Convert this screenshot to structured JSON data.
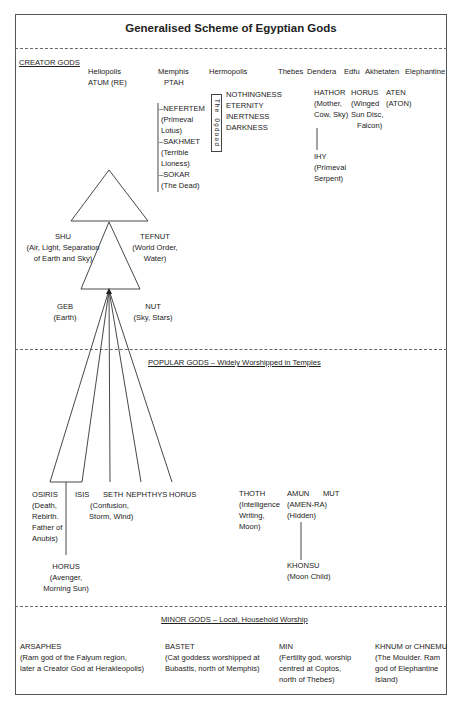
{
  "title": "Generalised Scheme of Egyptian Gods",
  "sections": {
    "creator": {
      "label": "CREATOR GODS",
      "places": [
        "Heliopolis",
        "Memphis",
        "Hermopolis",
        "Thebes",
        "Dendera",
        "Edfu",
        "Akhetaten",
        "Elephantine"
      ],
      "heliopolis_god": "ATUM (RE)",
      "memphis": {
        "god": "PTAH",
        "children": [
          "–NEFERTEM",
          "(Primeval",
          "Lotus)",
          "–SAKHMET",
          "(Terrible",
          "Lioness)",
          "–SOKAR",
          "(The Dead)"
        ]
      },
      "hermopolis": {
        "group_label": "The Ogdoad",
        "gods": [
          "NOTHINGNESS",
          "ETERNITY",
          "INERTNESS",
          "DARKNESS"
        ]
      },
      "dendera": {
        "name": "HATHOR",
        "desc1": "(Mother,",
        "desc2": "Cow, Sky)",
        "child": "IHY",
        "child_desc1": "(Primeval",
        "child_desc2": "Serpent)"
      },
      "edfu": {
        "name": "HORUS",
        "desc1": "(Winged",
        "desc2": "Sun Disc,",
        "desc3": "Falcon)"
      },
      "akhetaten": {
        "name": "ATEN",
        "desc1": "(ATON)"
      },
      "shu": {
        "name": "SHU",
        "desc1": "(Air, Light, Separation",
        "desc2": "of Earth and Sky)"
      },
      "tefnut": {
        "name": "TEFNUT",
        "desc1": "(World Order,",
        "desc2": "Water)"
      },
      "geb": {
        "name": "GEB",
        "desc1": "(Earth)"
      },
      "nut": {
        "name": "NUT",
        "desc1": "(Sky, Stars)"
      }
    },
    "popular": {
      "label": "POPULAR GODS – Widely Worshipped in Temples",
      "osiris": {
        "name": "OSIRIS",
        "lines": [
          "(Death,",
          "Rebirth.",
          "Father of",
          "Anubis)"
        ]
      },
      "isis": {
        "name": "ISIS"
      },
      "seth": {
        "name": "SETH",
        "desc1": "(Confusion,",
        "desc2": "Storm, Wind)"
      },
      "nephthys": {
        "name": "NEPHTHYS"
      },
      "horus": {
        "name": "HORUS"
      },
      "horus_child": {
        "name": "HORUS",
        "desc1": "(Avenger,",
        "desc2": "Morning Sun)"
      },
      "thoth": {
        "name": "THOTH",
        "lines": [
          "(Intelligence",
          "Writing,",
          "Moon)"
        ]
      },
      "amun": {
        "name": "AMUN",
        "desc1": "(AMEN-RA)",
        "desc2": "(Hidden)"
      },
      "mut": {
        "name": "MUT"
      },
      "khonsu": {
        "name": "KHONSU",
        "desc1": "(Moon Child)"
      }
    },
    "minor": {
      "label": "MINOR GODS – Local, Household Worship",
      "gods": [
        {
          "name": "ARSAPHES",
          "lines": [
            "(Ram god of the Faiyum region,",
            "later a Creator God at Herakleopolis)"
          ]
        },
        {
          "name": "BASTET",
          "lines": [
            "(Cat goddess worshipped at",
            "Bubastis, north of Memphis)"
          ]
        },
        {
          "name": "MIN",
          "lines": [
            "(Fertility god, worship",
            "centred at Coptos,",
            "north of Thebes)"
          ]
        },
        {
          "name": "KHNUM or CHNEMU",
          "lines": [
            "(The Moulder. Ram",
            "god of Elephantine",
            "Island)"
          ]
        }
      ]
    }
  }
}
